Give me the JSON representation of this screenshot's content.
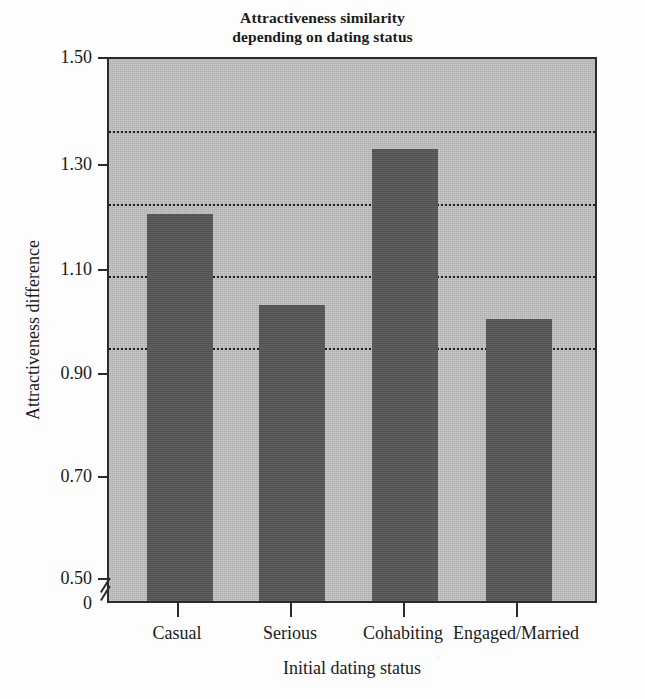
{
  "chart_data": {
    "type": "bar",
    "title": "Attractiveness similarity depending on dating status",
    "title_lines": [
      "Attractiveness similarity",
      "depending on dating status"
    ],
    "categories": [
      "Casual",
      "Serious",
      "Cohabiting",
      "Engaged/Married"
    ],
    "values": [
      1.07,
      0.82,
      1.25,
      0.78
    ],
    "xlabel": "Initial dating status",
    "ylabel": "Attractiveness difference",
    "ylim": [
      0.5,
      1.5
    ],
    "y_axis_origin_label": "0",
    "y_axis_has_break": true,
    "yticks": [
      1.5,
      1.3,
      1.1,
      0.9,
      0.7,
      0.5
    ],
    "ytick_labels": [
      "1.50",
      "1.30",
      "1.10",
      "0.90",
      "0.70",
      "0.50"
    ],
    "gridlines": [
      1.3,
      1.1,
      0.9,
      0.7
    ],
    "grid": true,
    "grid_style": "dotted",
    "legend": null,
    "legend_position": "none",
    "colors": {
      "bar": "#575757",
      "plot_background": "#bcbcbc",
      "axis": "#2b2b2b",
      "gridline": "#1f1f1f",
      "page_background": "#fdfdfd",
      "text": "#1a1a1a"
    }
  }
}
